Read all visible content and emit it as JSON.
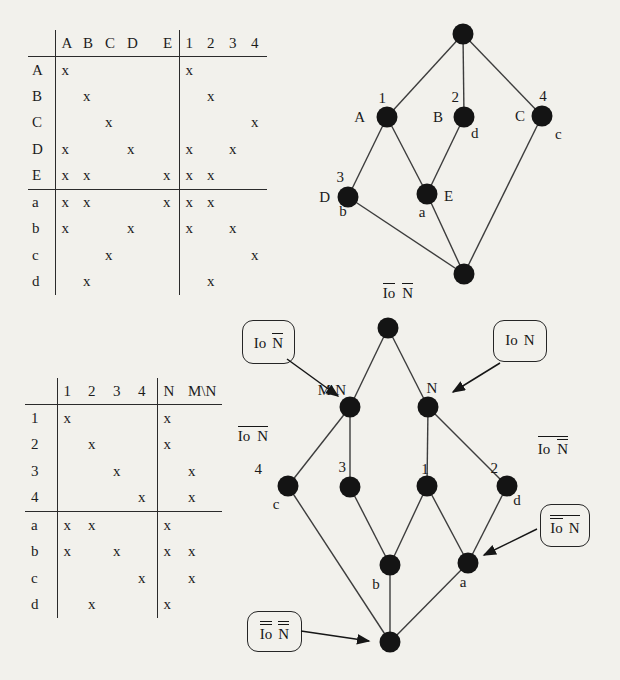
{
  "paper": {
    "background": "#f2f1ec",
    "ink": "#1a1a1a"
  },
  "mark": "x",
  "table1": {
    "columns": [
      "A",
      "B",
      "C",
      "D",
      "E",
      "1",
      "2",
      "3",
      "4"
    ],
    "sep_col": 4,
    "hline_row": 4,
    "rows": [
      {
        "label": "A",
        "cells": [
          1,
          0,
          0,
          0,
          0,
          1,
          0,
          0,
          0
        ]
      },
      {
        "label": "B",
        "cells": [
          0,
          1,
          0,
          0,
          0,
          0,
          1,
          0,
          0
        ]
      },
      {
        "label": "C",
        "cells": [
          0,
          0,
          1,
          0,
          0,
          0,
          0,
          0,
          1
        ]
      },
      {
        "label": "D",
        "cells": [
          1,
          0,
          0,
          1,
          0,
          1,
          0,
          1,
          0
        ]
      },
      {
        "label": "E",
        "cells": [
          1,
          1,
          0,
          0,
          1,
          1,
          1,
          0,
          0
        ]
      },
      {
        "label": "a",
        "cells": [
          1,
          1,
          0,
          0,
          1,
          1,
          1,
          0,
          0
        ]
      },
      {
        "label": "b",
        "cells": [
          1,
          0,
          0,
          1,
          0,
          1,
          0,
          1,
          0
        ]
      },
      {
        "label": "c",
        "cells": [
          0,
          0,
          1,
          0,
          0,
          0,
          0,
          0,
          1
        ]
      },
      {
        "label": "d",
        "cells": [
          0,
          1,
          0,
          0,
          0,
          0,
          1,
          0,
          0
        ]
      }
    ]
  },
  "table2": {
    "columns": [
      "1",
      "2",
      "3",
      "4",
      "N",
      "M\\N"
    ],
    "sep_col": 3,
    "hline_row": 3,
    "rows": [
      {
        "label": "1",
        "cells": [
          1,
          0,
          0,
          0,
          1,
          0
        ]
      },
      {
        "label": "2",
        "cells": [
          0,
          1,
          0,
          0,
          1,
          0
        ]
      },
      {
        "label": "3",
        "cells": [
          0,
          0,
          1,
          0,
          0,
          1
        ]
      },
      {
        "label": "4",
        "cells": [
          0,
          0,
          0,
          1,
          0,
          1
        ]
      },
      {
        "label": "a",
        "cells": [
          1,
          1,
          0,
          0,
          1,
          0
        ]
      },
      {
        "label": "b",
        "cells": [
          1,
          0,
          1,
          0,
          1,
          1
        ]
      },
      {
        "label": "c",
        "cells": [
          0,
          0,
          0,
          1,
          0,
          1
        ]
      },
      {
        "label": "d",
        "cells": [
          0,
          1,
          0,
          0,
          1,
          0
        ]
      }
    ]
  },
  "lattice1": {
    "nodes": {
      "top": {},
      "n1A": {
        "num": "1",
        "attr": "A"
      },
      "n2B": {
        "num": "2",
        "attr": "B",
        "obj": "d"
      },
      "n4C": {
        "num": "4",
        "attr": "C",
        "obj": "c"
      },
      "n3D": {
        "num": "3",
        "attr": "D",
        "obj": "b"
      },
      "naE": {
        "attr": "E",
        "obj": "a"
      },
      "bottom": {}
    },
    "edges": [
      [
        "top",
        "n1A"
      ],
      [
        "top",
        "n2B"
      ],
      [
        "top",
        "n4C"
      ],
      [
        "n1A",
        "n3D"
      ],
      [
        "n1A",
        "naE"
      ],
      [
        "n2B",
        "naE"
      ],
      [
        "n3D",
        "bottom"
      ],
      [
        "naE",
        "bottom"
      ],
      [
        "n4C",
        "bottom"
      ]
    ]
  },
  "lattice2": {
    "nodes": {
      "top": {},
      "MN": {
        "name": "M\\N"
      },
      "N": {
        "name": "N"
      },
      "n4c": {
        "num": "4",
        "obj": "c"
      },
      "n3": {
        "num": "3"
      },
      "n1": {
        "num": "1"
      },
      "n2d": {
        "num": "2",
        "obj": "d"
      },
      "b": {
        "obj": "b"
      },
      "a": {
        "obj": "a"
      },
      "bottom": {}
    },
    "edges": [
      [
        "top",
        "MN"
      ],
      [
        "top",
        "N"
      ],
      [
        "MN",
        "n4c"
      ],
      [
        "MN",
        "n3"
      ],
      [
        "N",
        "n1"
      ],
      [
        "N",
        "n2d"
      ],
      [
        "n3",
        "b"
      ],
      [
        "n1",
        "b"
      ],
      [
        "n1",
        "a"
      ],
      [
        "n2d",
        "a"
      ],
      [
        "n4c",
        "bottom"
      ],
      [
        "b",
        "bottom"
      ],
      [
        "a",
        "bottom"
      ]
    ]
  },
  "io_labels": {
    "top": {
      "io": "Io",
      "n": "N"
    },
    "callout_mn": {
      "io": "Io",
      "n": "N"
    },
    "callout_n": {
      "io": "Io",
      "n": "N"
    },
    "free_left": {
      "io": "Io",
      "n": "N"
    },
    "free_right": {
      "io": "Io",
      "n": "N"
    },
    "callout_a": {
      "io": "Io",
      "n": "N"
    },
    "callout_bottom": {
      "io": "Io",
      "n": "N"
    }
  }
}
